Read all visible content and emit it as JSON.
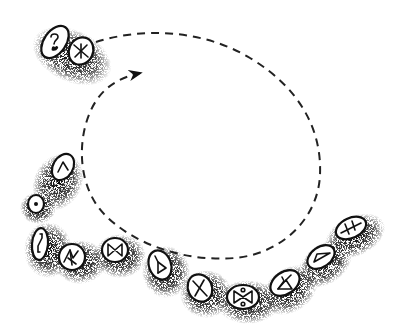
{
  "figure": {
    "title": "Rune stones arranged in an arc with a dashed circular path",
    "background": "#ffffff",
    "ink_color": "#111111",
    "stipple_color": "#222222"
  },
  "path": {
    "style": "dashed",
    "direction": "clockwise spiral ending with arrowhead",
    "start": [
      95,
      42
    ],
    "arrow_tip": [
      140,
      74
    ]
  },
  "stones": [
    {
      "id": 1,
      "symbol": "question-mark",
      "cx": 55,
      "cy": 42,
      "rx": 11,
      "ry": 18,
      "rot": 35
    },
    {
      "id": 2,
      "symbol": "asterisk-cross",
      "cx": 81,
      "cy": 51,
      "rx": 12,
      "ry": 14,
      "rot": 25
    },
    {
      "id": 3,
      "symbol": "caret",
      "cx": 63,
      "cy": 167,
      "rx": 10,
      "ry": 14,
      "rot": 30
    },
    {
      "id": 4,
      "symbol": "dot",
      "cx": 36,
      "cy": 204,
      "rx": 8,
      "ry": 9,
      "rot": 0
    },
    {
      "id": 5,
      "symbol": "sowilo",
      "cx": 40,
      "cy": 244,
      "rx": 8,
      "ry": 16,
      "rot": 5
    },
    {
      "id": 6,
      "symbol": "branch-rune",
      "cx": 72,
      "cy": 257,
      "rx": 13,
      "ry": 13,
      "rot": 0
    },
    {
      "id": 7,
      "symbol": "bowtie",
      "cx": 115,
      "cy": 250,
      "rx": 13,
      "ry": 12,
      "rot": 0
    },
    {
      "id": 8,
      "symbol": "flag-triangle",
      "cx": 160,
      "cy": 265,
      "rx": 11,
      "ry": 15,
      "rot": -20
    },
    {
      "id": 9,
      "symbol": "x-cross",
      "cx": 200,
      "cy": 288,
      "rx": 12,
      "ry": 14,
      "rot": -25
    },
    {
      "id": 10,
      "symbol": "bowtie-dots",
      "cx": 243,
      "cy": 297,
      "rx": 16,
      "ry": 12,
      "rot": 0
    },
    {
      "id": 11,
      "symbol": "othala-diamond",
      "cx": 285,
      "cy": 283,
      "rx": 16,
      "ry": 11,
      "rot": -35
    },
    {
      "id": 12,
      "symbol": "triangle",
      "cx": 321,
      "cy": 257,
      "rx": 15,
      "ry": 10,
      "rot": -35
    },
    {
      "id": 13,
      "symbol": "double-cross",
      "cx": 351,
      "cy": 228,
      "rx": 16,
      "ry": 10,
      "rot": -25
    }
  ]
}
